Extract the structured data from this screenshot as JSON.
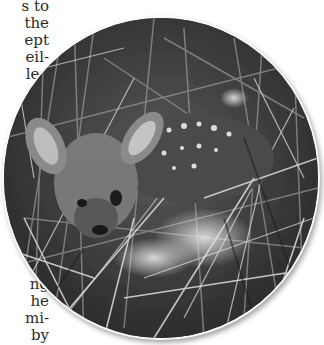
{
  "article": {
    "text_top_lines": [
      "s to",
      "the",
      "ept",
      "eil-",
      "led"
    ],
    "text_bottom_lines": [
      "ng",
      "he",
      "mi-",
      "by"
    ]
  },
  "photo": {
    "subject": "white-tailed deer fawn lying in tall grass",
    "style": "grayscale",
    "shape": "circle",
    "icon": "photo-image"
  }
}
